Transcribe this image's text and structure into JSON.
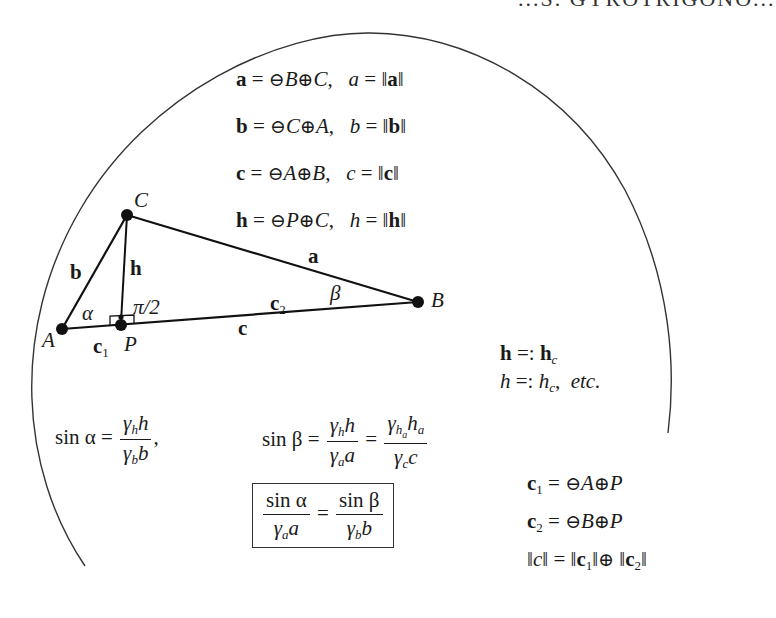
{
  "header": {
    "running_title": "...S. GYROTRIGONO..."
  },
  "definitions": [
    {
      "vector": "a",
      "expr_ominus": "B",
      "expr_oplus": "C",
      "norm_var": "a",
      "norm_of": "a"
    },
    {
      "vector": "b",
      "expr_ominus": "C",
      "expr_oplus": "A",
      "norm_var": "b",
      "norm_of": "b"
    },
    {
      "vector": "c",
      "expr_ominus": "A",
      "expr_oplus": "B",
      "norm_var": "c",
      "norm_of": "c"
    },
    {
      "vector": "h",
      "expr_ominus": "P",
      "expr_oplus": "C",
      "norm_var": "h",
      "norm_of": "h"
    }
  ],
  "symbols": {
    "ominus": "⊖",
    "oplus": "⊕",
    "eq": "=",
    "defeq": "=:",
    "norm": "‖",
    "comma": ",",
    "etc": "etc."
  },
  "triangle": {
    "vertices": {
      "A": {
        "label": "A",
        "x": 62,
        "y": 329
      },
      "B": {
        "label": "B",
        "x": 418,
        "y": 302
      },
      "C": {
        "label": "C",
        "x": 127,
        "y": 215
      },
      "P": {
        "label": "P",
        "x": 121,
        "y": 325
      }
    },
    "side_labels": {
      "a": "a",
      "b": "b",
      "c": "c",
      "h": "h",
      "c1": "c",
      "c1_sub": "1",
      "c2": "c",
      "c2_sub": "2"
    },
    "angle_labels": {
      "alpha": "α",
      "beta": "β",
      "right_angle": "π/2"
    }
  },
  "notation": {
    "line1": {
      "lhs": "h",
      "rhs": "h",
      "rhs_sub": "c"
    },
    "line2": {
      "lhs": "h",
      "rhs": "h",
      "rhs_sub": "c",
      "suffix": "etc."
    }
  },
  "law_of_sines": {
    "sin_alpha": {
      "lhs": "sin α",
      "num_gamma_sub": "h",
      "num_var": "h",
      "den_gamma_sub": "b",
      "den_var": "b"
    },
    "sin_beta": {
      "lhs": "sin β",
      "frac1": {
        "num_gamma_sub": "h",
        "num_var": "h",
        "den_gamma_sub": "a",
        "den_var": "a"
      },
      "frac2": {
        "num_gamma_sub": "h",
        "num_gamma_subsub": "a",
        "num_var": "h",
        "num_var_sub": "a",
        "den_gamma_sub": "c",
        "den_var": "c"
      }
    },
    "boxed": {
      "left": {
        "num": "sin α",
        "den_gamma_sub": "a",
        "den_var": "a"
      },
      "right": {
        "num": "sin β",
        "den_gamma_sub": "b",
        "den_var": "b"
      }
    }
  },
  "segments": [
    {
      "vector": "c",
      "sub": "1",
      "ominus": "A",
      "oplus": "P"
    },
    {
      "vector": "c",
      "sub": "2",
      "ominus": "B",
      "oplus": "P"
    }
  ],
  "norm_sum": {
    "lhs": "c",
    "t1": "c",
    "t1_sub": "1",
    "t2": "c",
    "t2_sub": "2"
  },
  "gamma": "γ",
  "colors": {
    "ink": "#1a1a1a",
    "arc": "#333333",
    "background": "#ffffff"
  }
}
